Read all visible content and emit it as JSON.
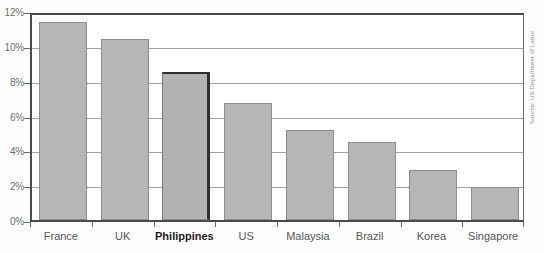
{
  "chart_data": {
    "type": "bar",
    "title": "",
    "subtitle": "",
    "xlabel": "",
    "ylabel": "",
    "categories": [
      "France",
      "UK",
      "Philippines",
      "US",
      "Malaysia",
      "Brazil",
      "Korea",
      "Singapore"
    ],
    "values": [
      11.5,
      10.5,
      8.6,
      6.8,
      5.2,
      4.5,
      2.9,
      1.9
    ],
    "value_suffix": "%",
    "ylim": [
      0,
      12
    ],
    "ytick_step": 2,
    "ytick_labels": [
      "0%",
      "2%",
      "4%",
      "6%",
      "8%",
      "10%",
      "12%"
    ],
    "ytick_values": [
      0,
      2,
      4,
      6,
      8,
      10,
      12
    ],
    "grid": true,
    "grid_axis": "y",
    "legend": false,
    "legend_position": "none",
    "highlighted_category": "Philippines",
    "bar_color": "#b6b6b6",
    "bar_border_color": "#8d8d8d",
    "highlight_border_color": "#2f2f2f",
    "grid_color": "#a2a2a2",
    "axis_color": "#4a4a4a",
    "tick_label_color": "#6f6f6f",
    "category_label_color": "#555555"
  },
  "annotations": {
    "source_note": "Source: US Department of Labor"
  }
}
